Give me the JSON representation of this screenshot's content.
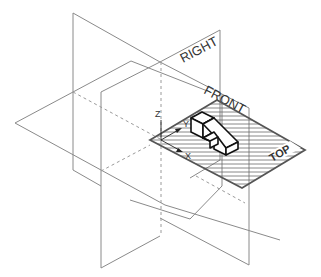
{
  "diagram": {
    "planes": {
      "right_label": "RIGHT",
      "front_label": "FRONT",
      "top_label": "TOP"
    },
    "axes": {
      "x_label": "X",
      "y_label": "Y",
      "z_label": "Z"
    },
    "colors": {
      "plane_lines": "#8a8a8a",
      "object_outline": "#111111",
      "top_plane_outline": "#555555",
      "hatch": "#6b6b6b",
      "background": "#ffffff"
    }
  }
}
